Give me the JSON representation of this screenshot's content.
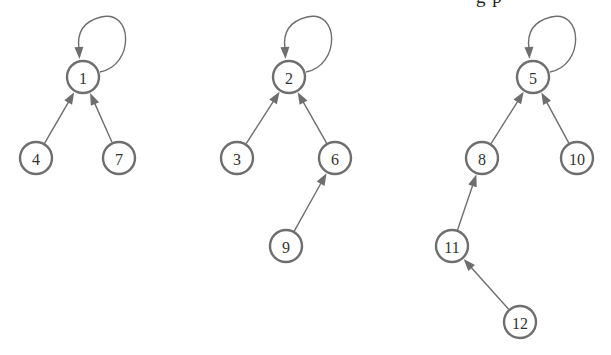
{
  "figure": {
    "caption_fragment": "g p",
    "colors": {
      "node_stroke": "#6e6e6e",
      "node_fill": "#ffffff",
      "edge": "#6e6e6e",
      "label": "#333333"
    },
    "node_radius": 16,
    "trees": [
      {
        "root": "1",
        "nodes": [
          {
            "id": "1",
            "label": "1",
            "x": 83,
            "y": 77
          },
          {
            "id": "4",
            "label": "4",
            "x": 36,
            "y": 158
          },
          {
            "id": "7",
            "label": "7",
            "x": 119,
            "y": 158
          }
        ],
        "edges": [
          {
            "from": "4",
            "to": "1"
          },
          {
            "from": "7",
            "to": "1"
          }
        ],
        "self_loop": "1"
      },
      {
        "root": "2",
        "nodes": [
          {
            "id": "2",
            "label": "2",
            "x": 289,
            "y": 77
          },
          {
            "id": "3",
            "label": "3",
            "x": 237,
            "y": 158
          },
          {
            "id": "6",
            "label": "6",
            "x": 335,
            "y": 158
          },
          {
            "id": "9",
            "label": "9",
            "x": 286,
            "y": 246
          }
        ],
        "edges": [
          {
            "from": "3",
            "to": "2"
          },
          {
            "from": "6",
            "to": "2"
          },
          {
            "from": "9",
            "to": "6"
          }
        ],
        "self_loop": "2"
      },
      {
        "root": "5",
        "nodes": [
          {
            "id": "5",
            "label": "5",
            "x": 533,
            "y": 77
          },
          {
            "id": "8",
            "label": "8",
            "x": 482,
            "y": 158
          },
          {
            "id": "10",
            "label": "10",
            "x": 577,
            "y": 158
          },
          {
            "id": "11",
            "label": "11",
            "x": 452,
            "y": 246
          },
          {
            "id": "12",
            "label": "12",
            "x": 520,
            "y": 322
          }
        ],
        "edges": [
          {
            "from": "8",
            "to": "5"
          },
          {
            "from": "10",
            "to": "5"
          },
          {
            "from": "11",
            "to": "8"
          },
          {
            "from": "12",
            "to": "11"
          }
        ],
        "self_loop": "5"
      }
    ]
  }
}
